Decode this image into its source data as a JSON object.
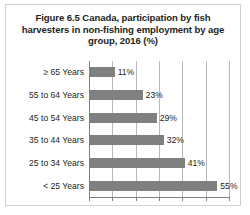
{
  "figure": {
    "title": "Figure 6.5 Canada, participation by fish harvesters in non-fishing employment by age group, 2016 (%)"
  },
  "chart_data": {
    "type": "bar",
    "orientation": "horizontal",
    "title": "Figure 6.5 Canada, participation by fish harvesters in non-fishing employment by age group, 2016 (%)",
    "xlabel": "",
    "ylabel": "",
    "xlim": [
      0,
      60
    ],
    "grid": true,
    "gridlines": [
      0,
      10,
      20,
      30,
      40,
      50,
      60
    ],
    "xtick_labels": [],
    "legend": false,
    "bar_color": "#808080",
    "categories": [
      "≥ 65 Years",
      "55 to 64 Years",
      "45 to 54 Years",
      "35 to 44 Years",
      "25 to 34 Years",
      "< 25 Years"
    ],
    "values": [
      11,
      23,
      29,
      32,
      41,
      55
    ],
    "data_labels": [
      "11%",
      "23%",
      "29%",
      "32%",
      "41%",
      "55%"
    ]
  }
}
